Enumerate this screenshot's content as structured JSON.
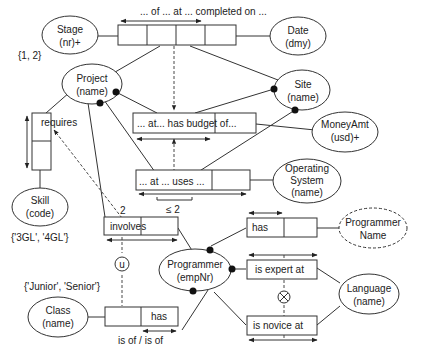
{
  "diagram": {
    "type": "ORM conceptual schema",
    "entities": {
      "stage": {
        "name": "Stage",
        "ref": "(nr)+",
        "values": "{1, 2}"
      },
      "date": {
        "name": "Date",
        "ref": "(dmy)"
      },
      "project": {
        "name": "Project",
        "ref": "(name)"
      },
      "site": {
        "name": "Site",
        "ref": "(name)"
      },
      "money": {
        "name": "MoneyAmt",
        "ref": "(usd)+"
      },
      "os": {
        "name1": "Operating",
        "name2": "System",
        "ref": "(name)"
      },
      "skill": {
        "name": "Skill",
        "ref": "(code)",
        "values": "{'3GL', '4GL'}"
      },
      "programmer": {
        "name": "Programmer",
        "ref": "(empNr)"
      },
      "progname": {
        "name1": "Programmer",
        "name2": "Name"
      },
      "class": {
        "name": "Class",
        "ref": "(name)",
        "values": "{'Junior', 'Senior'}"
      },
      "language": {
        "name": "Language",
        "ref": "(name)"
      }
    },
    "facts": {
      "completed": "... of ... at ... completed on ...",
      "budget": "... at... has budget of...",
      "uses": "... at ... uses ...",
      "requires": "requires",
      "involves": "involves",
      "has_name": "has",
      "has_class": "has",
      "has_class_reading": "is of / is of",
      "expert": "is expert at",
      "novice": "is novice at"
    },
    "constraints": {
      "uses_freq": "≤ 2",
      "involves_freq": "2",
      "unique": "u",
      "exclusion": "⊗"
    }
  }
}
